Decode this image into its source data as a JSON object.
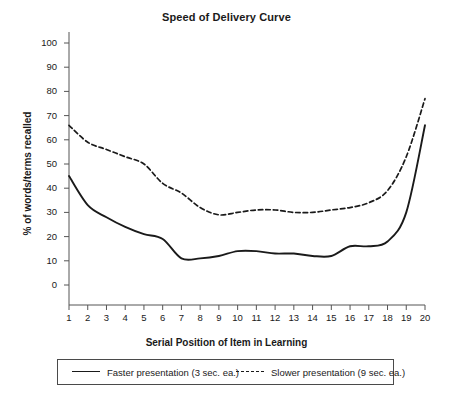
{
  "chart_data": {
    "type": "line",
    "title": "Speed of Delivery Curve",
    "xlabel": "Serial Position of Item in Learning",
    "ylabel": "% of words/terms recalled",
    "xlim": [
      1,
      20
    ],
    "ylim": [
      0,
      100
    ],
    "grid": false,
    "legend_position": "below-plot",
    "x": [
      1,
      2,
      3,
      4,
      5,
      6,
      7,
      8,
      9,
      10,
      11,
      12,
      13,
      14,
      15,
      16,
      17,
      18,
      19,
      20
    ],
    "xticks": [
      "1",
      "2",
      "3",
      "4",
      "5",
      "6",
      "7",
      "8",
      "9",
      "10",
      "11",
      "12",
      "13",
      "14",
      "15",
      "16",
      "17",
      "18",
      "19",
      "20"
    ],
    "yticks": [
      "0",
      "10",
      "20",
      "30",
      "40",
      "50",
      "60",
      "70",
      "80",
      "90",
      "100"
    ],
    "series": [
      {
        "name": "Faster presentation (3 sec. ea.)",
        "style": "solid",
        "color": "#1a1a1a",
        "values": [
          45,
          33,
          28,
          24,
          21,
          19,
          11,
          11,
          12,
          14,
          14,
          13,
          13,
          12,
          12,
          16,
          16,
          18,
          30,
          66
        ]
      },
      {
        "name": "Slower presentation (9 sec. ea.)",
        "style": "dashed",
        "color": "#1a1a1a",
        "values": [
          66,
          59,
          56,
          53,
          50,
          42,
          38,
          32,
          29,
          30,
          31,
          31,
          30,
          30,
          31,
          32,
          34,
          39,
          53,
          77
        ]
      }
    ]
  },
  "legend": {
    "entries": [
      {
        "label": "Faster presentation (3 sec. ea.)",
        "style": "solid"
      },
      {
        "label": "Slower presentation (9 sec. ea.)",
        "style": "dashed"
      }
    ]
  },
  "colors": {
    "line": "#1a1a1a",
    "axis": "#555555",
    "background": "#ffffff"
  }
}
